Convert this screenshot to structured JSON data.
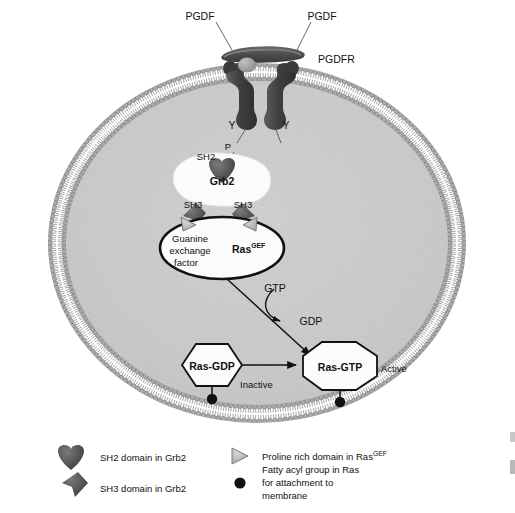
{
  "figure": {
    "background_color": "#ffffff",
    "cytoplasm_color": "#c9c9c9",
    "membrane_color": "#8f8f8f",
    "protein_dark_color": "#4a4a4a",
    "protein_light_color": "#b5b5b5",
    "outline_color": "#111111"
  },
  "extracellular": {
    "ligand_left_label": "PGDF",
    "ligand_right_label": "PGDF",
    "receptor_label": "PGDFR"
  },
  "receptor": {
    "tyrosine_left": "Y",
    "tyrosine_right": "Y",
    "phosphate": "P"
  },
  "grb2": {
    "name": "Grb2",
    "sh2_label": "SH2",
    "sh3_left_label": "SH3",
    "sh3_right_label": "SH3"
  },
  "ras_gef": {
    "name": "Ras",
    "name_superscript": "GEF",
    "description_line1": "Guanine",
    "description_line2": "exchange",
    "description_line3": "factor"
  },
  "nucleotides": {
    "gtp": "GTP",
    "gdp": "GDP"
  },
  "ras_states": {
    "inactive": {
      "label": "Ras-GDP",
      "state": "Inactive"
    },
    "active": {
      "label": "Ras-GTP",
      "state": "Active"
    }
  },
  "legend": {
    "items": [
      {
        "icon": "sh2-domain-icon",
        "text": "SH2 domain in Grb2"
      },
      {
        "icon": "sh3-domain-icon",
        "text": "SH3 domain in Grb2"
      },
      {
        "icon": "proline-rich-domain-icon",
        "text": "Proline rich domain in Ras",
        "text_superscript": "GEF"
      },
      {
        "icon": "fatty-acyl-group-icon",
        "text_line1": "Fatty acyl group in Ras",
        "text_line2": "for attachment to",
        "text_line3": "membrane"
      }
    ]
  }
}
